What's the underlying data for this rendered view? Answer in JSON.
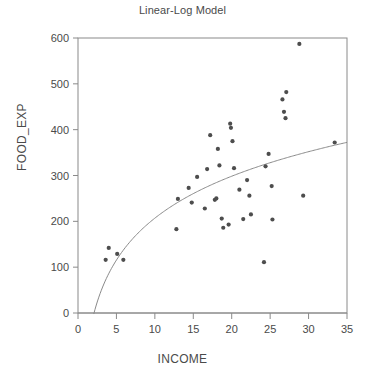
{
  "chart_data": {
    "type": "scatter",
    "title": "Linear-Log Model",
    "xlabel": "INCOME",
    "ylabel": "FOOD_EXP",
    "xlim": [
      0,
      35
    ],
    "ylim": [
      0,
      600
    ],
    "xticks": [
      0,
      5,
      10,
      15,
      20,
      25,
      30,
      35
    ],
    "yticks": [
      0,
      100,
      200,
      300,
      400,
      500,
      600
    ],
    "grid": false,
    "legend": null,
    "marker_color": "#4d4d4d",
    "line_color": "#8a8a8a",
    "frame_color": "#8a8a8a",
    "points": [
      {
        "x": 3.6,
        "y": 116
      },
      {
        "x": 4.0,
        "y": 142
      },
      {
        "x": 5.1,
        "y": 129
      },
      {
        "x": 5.9,
        "y": 116
      },
      {
        "x": 12.8,
        "y": 183
      },
      {
        "x": 13.0,
        "y": 249
      },
      {
        "x": 14.4,
        "y": 273
      },
      {
        "x": 14.8,
        "y": 241
      },
      {
        "x": 15.5,
        "y": 297
      },
      {
        "x": 16.5,
        "y": 228
      },
      {
        "x": 16.8,
        "y": 314
      },
      {
        "x": 17.2,
        "y": 388
      },
      {
        "x": 17.8,
        "y": 247
      },
      {
        "x": 18.0,
        "y": 250
      },
      {
        "x": 18.2,
        "y": 358
      },
      {
        "x": 18.4,
        "y": 322
      },
      {
        "x": 18.7,
        "y": 206
      },
      {
        "x": 18.9,
        "y": 186
      },
      {
        "x": 19.8,
        "y": 413
      },
      {
        "x": 19.9,
        "y": 404
      },
      {
        "x": 19.6,
        "y": 193
      },
      {
        "x": 20.1,
        "y": 375
      },
      {
        "x": 20.3,
        "y": 316
      },
      {
        "x": 21.0,
        "y": 269
      },
      {
        "x": 21.5,
        "y": 205
      },
      {
        "x": 22.0,
        "y": 290
      },
      {
        "x": 22.3,
        "y": 256
      },
      {
        "x": 22.5,
        "y": 215
      },
      {
        "x": 24.2,
        "y": 111
      },
      {
        "x": 24.4,
        "y": 320
      },
      {
        "x": 24.8,
        "y": 347
      },
      {
        "x": 25.3,
        "y": 204
      },
      {
        "x": 25.2,
        "y": 277
      },
      {
        "x": 26.6,
        "y": 466
      },
      {
        "x": 26.8,
        "y": 439
      },
      {
        "x": 27.1,
        "y": 482
      },
      {
        "x": 27.0,
        "y": 425
      },
      {
        "x": 28.8,
        "y": 587
      },
      {
        "x": 29.3,
        "y": 256
      },
      {
        "x": 33.4,
        "y": 372
      }
    ],
    "fit_curve": {
      "label": "linear-log fit",
      "form": "y = a + b*ln(x)",
      "a": -97,
      "b": 132,
      "x_start": 2.05,
      "x_end": 35
    }
  }
}
